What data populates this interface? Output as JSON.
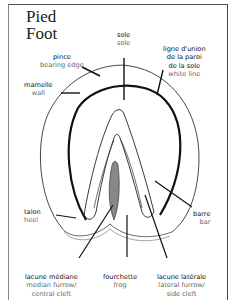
{
  "title": {
    "line1": "Pied",
    "line2": "Foot"
  },
  "labels": {
    "pince": {
      "fr": "pince",
      "en": "bearing  edge"
    },
    "mamelle": {
      "fr": "mamelle",
      "en": "wall"
    },
    "sole": {
      "fr": "sole",
      "en": "sole"
    },
    "ligne": {
      "fr1": "ligne  d'union",
      "fr2": "de  la  paroi",
      "fr3": "de  la  sole",
      "en": "white  line"
    },
    "talon": {
      "fr": "talon",
      "en": "heel"
    },
    "barre": {
      "fr": "barre",
      "en": "bar"
    },
    "lacune_mediane": {
      "fr": "lacune  médiane",
      "en1": "median  furrow/",
      "en2": "central  cleft"
    },
    "fourchette": {
      "fr": "fourchette",
      "en": "frog"
    },
    "lacune_laterale": {
      "fr": "lacune  latérale",
      "en1": "lateral  furrow/",
      "en2": "side  cleft"
    }
  },
  "colors": {
    "line": "#1a1a1a",
    "text_fr": "#111111",
    "text_en": "#666666"
  }
}
